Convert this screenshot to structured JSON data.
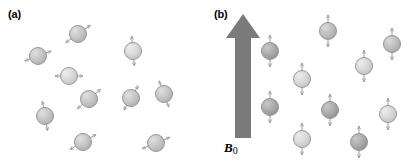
{
  "figure": {
    "width": 415,
    "height": 164,
    "background": "#ffffff",
    "caption_style": "two-panel scientific schematic of nuclear spin orientations"
  },
  "colors": {
    "sphere_fill_light": "#d4d4d4",
    "sphere_fill_mid": "#bdbdbd",
    "sphere_fill_dark": "#a8a8a8",
    "sphere_highlight": "#e8e8e8",
    "sphere_stroke": "#8e8e8e",
    "arrow_stroke": "#9a9a9a",
    "field_arrow_fill": "#7a7a7a",
    "text": "#000000"
  },
  "panels": [
    {
      "id": "a",
      "label": "(a)",
      "description": "randomly oriented spins, no external magnetic field",
      "sphere_radius": 8.5,
      "spins": [
        {
          "cx": 78,
          "cy": 34,
          "angle_deg": 35,
          "arrow_len": 15,
          "shade": "mid"
        },
        {
          "cx": 38,
          "cy": 56,
          "angle_deg": 20,
          "arrow_len": 14,
          "shade": "mid"
        },
        {
          "cx": 133,
          "cy": 51,
          "angle_deg": 95,
          "arrow_len": 15,
          "shade": "light"
        },
        {
          "cx": 69,
          "cy": 76,
          "angle_deg": 0,
          "arrow_len": 14,
          "shade": "light"
        },
        {
          "cx": 89,
          "cy": 99,
          "angle_deg": 40,
          "arrow_len": 15,
          "shade": "mid"
        },
        {
          "cx": 131,
          "cy": 98,
          "angle_deg": 60,
          "arrow_len": 14,
          "shade": "mid"
        },
        {
          "cx": 164,
          "cy": 94,
          "angle_deg": 110,
          "arrow_len": 14,
          "shade": "mid"
        },
        {
          "cx": 45,
          "cy": 116,
          "angle_deg": 100,
          "arrow_len": 15,
          "shade": "mid"
        },
        {
          "cx": 83,
          "cy": 142,
          "angle_deg": 30,
          "arrow_len": 15,
          "shade": "mid"
        },
        {
          "cx": 156,
          "cy": 143,
          "angle_deg": 22,
          "arrow_len": 15,
          "shade": "mid"
        }
      ]
    },
    {
      "id": "b",
      "label": "(b)",
      "description": "spins aligned parallel or antiparallel with the static field B0",
      "sphere_radius": 8.5,
      "field_arrow": {
        "label": "B",
        "label_subscript": "0",
        "direction": "up",
        "shaft_x": 36,
        "shaft_top": 38,
        "shaft_bottom": 138,
        "shaft_half_width": 8,
        "head_tip_y": 14,
        "head_half_width": 17
      },
      "spins": [
        {
          "cx": 63,
          "cy": 51,
          "angle_deg": 90,
          "arrow_len": 16,
          "shade": "dark"
        },
        {
          "cx": 95,
          "cy": 79,
          "angle_deg": 90,
          "arrow_len": 16,
          "shade": "light"
        },
        {
          "cx": 121,
          "cy": 31,
          "angle_deg": 90,
          "arrow_len": 16,
          "shade": "mid"
        },
        {
          "cx": 157,
          "cy": 66,
          "angle_deg": 90,
          "arrow_len": 16,
          "shade": "light"
        },
        {
          "cx": 185,
          "cy": 44,
          "angle_deg": 90,
          "arrow_len": 16,
          "shade": "mid"
        },
        {
          "cx": 63,
          "cy": 107,
          "angle_deg": 90,
          "arrow_len": 16,
          "shade": "dark"
        },
        {
          "cx": 95,
          "cy": 139,
          "angle_deg": 90,
          "arrow_len": 16,
          "shade": "light"
        },
        {
          "cx": 123,
          "cy": 110,
          "angle_deg": 90,
          "arrow_len": 16,
          "shade": "dark"
        },
        {
          "cx": 152,
          "cy": 142,
          "angle_deg": 90,
          "arrow_len": 16,
          "shade": "dark"
        },
        {
          "cx": 181,
          "cy": 114,
          "angle_deg": 90,
          "arrow_len": 16,
          "shade": "light"
        }
      ]
    }
  ]
}
